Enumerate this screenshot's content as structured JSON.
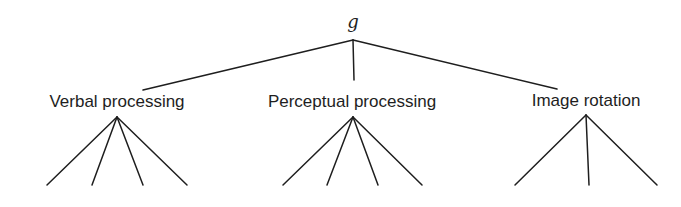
{
  "diagram": {
    "type": "tree",
    "root": {
      "label": "g",
      "x": 353,
      "y": 40
    },
    "factors": [
      {
        "label": "Verbal processing",
        "label_x": 117,
        "label_y": 92,
        "anchor": {
          "x": 143,
          "y": 90
        },
        "apex": {
          "x": 117,
          "y": 117
        },
        "leaves": [
          {
            "x": 47,
            "y": 185
          },
          {
            "x": 92,
            "y": 185
          },
          {
            "x": 143,
            "y": 185
          },
          {
            "x": 187,
            "y": 185
          }
        ]
      },
      {
        "label": "Perceptual processing",
        "label_x": 352,
        "label_y": 92,
        "anchor": {
          "x": 354,
          "y": 80
        },
        "apex": {
          "x": 353,
          "y": 117
        },
        "leaves": [
          {
            "x": 283,
            "y": 185
          },
          {
            "x": 327,
            "y": 185
          },
          {
            "x": 378,
            "y": 185
          },
          {
            "x": 422,
            "y": 185
          }
        ]
      },
      {
        "label": "Image rotation",
        "label_x": 586,
        "label_y": 91,
        "anchor": {
          "x": 557,
          "y": 89
        },
        "apex": {
          "x": 586,
          "y": 115
        },
        "leaves": [
          {
            "x": 515,
            "y": 185
          },
          {
            "x": 589,
            "y": 185
          },
          {
            "x": 657,
            "y": 185
          }
        ]
      }
    ],
    "colors": {
      "line": "#1e1e1e",
      "text": "#1e1e1e",
      "background": "#ffffff"
    }
  }
}
